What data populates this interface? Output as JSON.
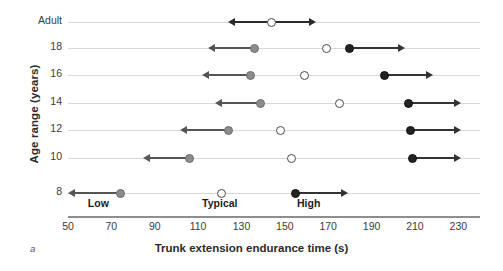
{
  "panel_letter": "a",
  "axes": {
    "y_title": "Age range (years)",
    "x_title": "Trunk extension endurance time (s)"
  },
  "band_labels": [
    {
      "text": "Low",
      "x_value": 64
    },
    {
      "text": "Typical",
      "x_value": 120
    },
    {
      "text": "High",
      "x_value": 161
    }
  ],
  "chart_data": {
    "type": "scatter",
    "title": "",
    "xlabel": "Trunk extension endurance time (s)",
    "ylabel": "Age range (years)",
    "xlim": [
      50,
      240
    ],
    "ylim": null,
    "grid": true,
    "legend_position": "none",
    "xticks": [
      50,
      70,
      90,
      110,
      130,
      150,
      170,
      190,
      210,
      230
    ],
    "categories": [
      "Adult",
      "18",
      "16",
      "14",
      "12",
      "10",
      "8"
    ],
    "series": [
      {
        "name": "Low threshold",
        "marker": "filled-gray-circle",
        "color": "#8c8c8c",
        "arrow": "left",
        "values": [
          null,
          136,
          134,
          139,
          124,
          106,
          74
        ]
      },
      {
        "name": "Typical",
        "marker": "open-circle",
        "color": "#ffffff",
        "arrow": "none",
        "values": [
          144,
          169,
          159,
          175,
          148,
          153,
          121
        ]
      },
      {
        "name": "High threshold",
        "marker": "filled-black-circle",
        "color": "#222222",
        "arrow": "right",
        "values": [
          null,
          180,
          196,
          207,
          208,
          209,
          155
        ]
      }
    ],
    "rows": [
      {
        "label": "Adult",
        "points": [
          {
            "type": "open",
            "value": 144,
            "arrow_left_to": 127,
            "arrow_right_to": 161
          }
        ]
      },
      {
        "label": "18",
        "points": [
          {
            "type": "gray",
            "value": 136,
            "arrow_left_to": 118
          },
          {
            "type": "open",
            "value": 169
          },
          {
            "type": "black",
            "value": 180,
            "arrow_right_to": 202
          }
        ]
      },
      {
        "label": "16",
        "points": [
          {
            "type": "gray",
            "value": 134,
            "arrow_left_to": 115
          },
          {
            "type": "open",
            "value": 159
          },
          {
            "type": "black",
            "value": 196,
            "arrow_right_to": 215
          }
        ]
      },
      {
        "label": "14",
        "points": [
          {
            "type": "gray",
            "value": 139,
            "arrow_left_to": 121
          },
          {
            "type": "open",
            "value": 175
          },
          {
            "type": "black",
            "value": 207,
            "arrow_right_to": 228
          }
        ]
      },
      {
        "label": "12",
        "points": [
          {
            "type": "gray",
            "value": 124,
            "arrow_left_to": 105
          },
          {
            "type": "open",
            "value": 148
          },
          {
            "type": "black",
            "value": 208,
            "arrow_right_to": 228
          }
        ]
      },
      {
        "label": "10",
        "points": [
          {
            "type": "gray",
            "value": 106,
            "arrow_left_to": 88
          },
          {
            "type": "open",
            "value": 153
          },
          {
            "type": "black",
            "value": 209,
            "arrow_right_to": 228
          }
        ]
      },
      {
        "label": "8",
        "points": [
          {
            "type": "gray",
            "value": 74,
            "arrow_left_to": 53
          },
          {
            "type": "open",
            "value": 121
          },
          {
            "type": "black",
            "value": 155,
            "arrow_right_to": 176
          }
        ]
      }
    ]
  },
  "colors": {
    "gridline": "#d9d9d9",
    "axis": "#8e8e8e",
    "low": "#8c8c8c",
    "typical": "#ffffff",
    "high": "#222222",
    "text": "#2b2b2b"
  }
}
